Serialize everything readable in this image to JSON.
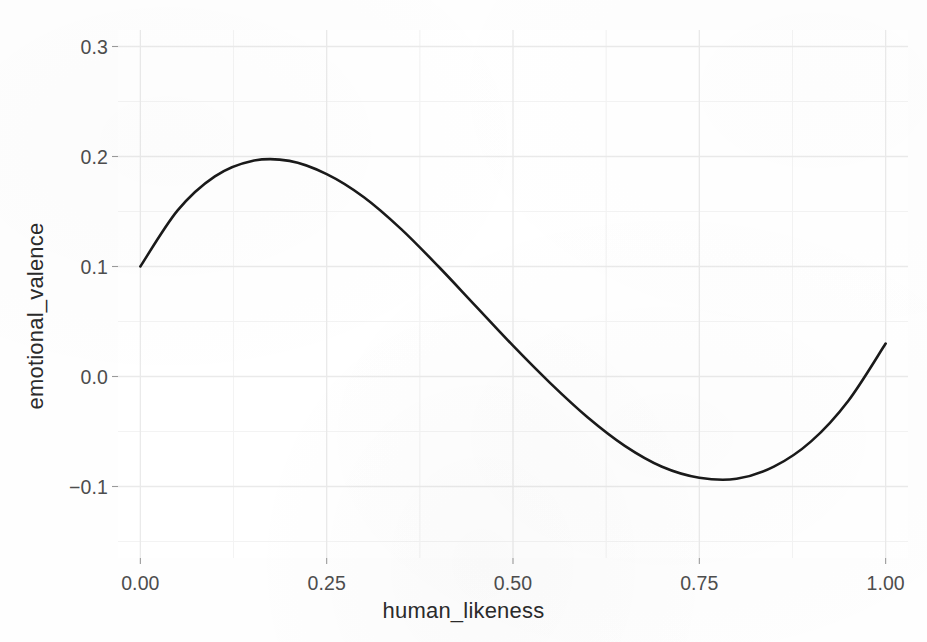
{
  "chart_data": {
    "type": "line",
    "title": "",
    "subtitle": "",
    "xlabel": "human_likeness",
    "ylabel": "emotional_valence",
    "xlim": [
      -0.03,
      1.03
    ],
    "ylim": [
      -0.165,
      0.315
    ],
    "xticks": [
      "0.00",
      "0.25",
      "0.50",
      "0.75",
      "1.00"
    ],
    "xtick_values": [
      0.0,
      0.25,
      0.5,
      0.75,
      1.0
    ],
    "yticks": [
      "0.3",
      "0.2",
      "0.1",
      "0.0",
      "−0.1"
    ],
    "ytick_values": [
      0.3,
      0.2,
      0.1,
      0.0,
      -0.1
    ],
    "grid": true,
    "minor_grid": true,
    "legend": "none",
    "series": [
      {
        "name": "emotional_valence",
        "color": "#1a1a1a",
        "linewidth": 2.6,
        "x": [
          0.0,
          0.05,
          0.1,
          0.15,
          0.2,
          0.25,
          0.3,
          0.35,
          0.4,
          0.45,
          0.5,
          0.55,
          0.6,
          0.65,
          0.7,
          0.75,
          0.8,
          0.85,
          0.9,
          0.95,
          1.0
        ],
        "values": [
          0.1,
          0.151,
          0.182,
          0.196,
          0.196,
          0.184,
          0.163,
          0.134,
          0.1,
          0.064,
          0.028,
          -0.006,
          -0.037,
          -0.063,
          -0.082,
          -0.092,
          -0.093,
          -0.082,
          -0.059,
          -0.022,
          0.03
        ]
      }
    ],
    "curve_features": {
      "start_point": [
        0.0,
        0.1
      ],
      "local_maximum": [
        0.2,
        0.196
      ],
      "zero_crossing": [
        0.5,
        0.0
      ],
      "local_minimum": [
        0.74,
        -0.137
      ],
      "end_point": [
        1.0,
        0.293
      ]
    },
    "colors": {
      "line": "#1a1a1a",
      "panel_background": "#ffffff",
      "major_gridline": "#ebebeb",
      "minor_gridline": "#f4f4f4",
      "tick_text": "#4d4d4d",
      "axis_title_text": "#2b2b2b"
    }
  },
  "axes": {
    "x_title": "human_likeness",
    "y_title": "emotional_valence",
    "x_tick_labels": [
      "0.00",
      "0.25",
      "0.50",
      "0.75",
      "1.00"
    ],
    "y_tick_labels": [
      "0.3",
      "0.2",
      "0.1",
      "0.0",
      "−0.1"
    ]
  }
}
